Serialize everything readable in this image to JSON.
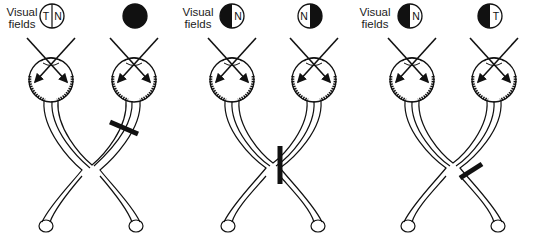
{
  "figure": {
    "panels": [
      {
        "id": "optic-nerve-lesion",
        "label_line1": "Visual",
        "label_line2": "fields",
        "left_eye_field": {
          "left_half": "white",
          "right_half": "white",
          "left_letter": "T",
          "right_letter": "N"
        },
        "right_eye_field": {
          "left_half": "black",
          "right_half": "black",
          "left_letter": "",
          "right_letter": ""
        },
        "lesion": "right optic nerve"
      },
      {
        "id": "chiasm-lesion",
        "label_line1": "Visual",
        "label_line2": "fields",
        "left_eye_field": {
          "left_half": "black",
          "right_half": "white",
          "left_letter": "",
          "right_letter": "N"
        },
        "right_eye_field": {
          "left_half": "white",
          "right_half": "black",
          "left_letter": "N",
          "right_letter": ""
        },
        "lesion": "optic chiasm (midline)"
      },
      {
        "id": "optic-tract-lesion",
        "label_line1": "Visual",
        "label_line2": "fields",
        "left_eye_field": {
          "left_half": "black",
          "right_half": "white",
          "left_letter": "",
          "right_letter": "N"
        },
        "right_eye_field": {
          "left_half": "black",
          "right_half": "white",
          "left_letter": "",
          "right_letter": "T"
        },
        "lesion": "right optic tract"
      }
    ],
    "colors": {
      "ink": "#111111",
      "background": "#ffffff"
    }
  }
}
